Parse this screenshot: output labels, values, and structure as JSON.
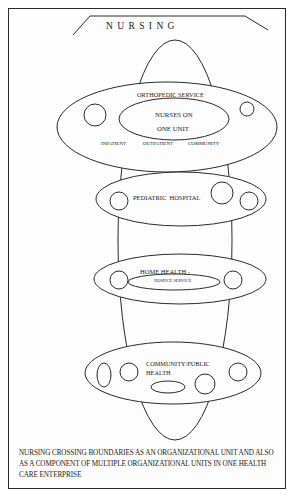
{
  "title": "N U R S I N G",
  "units": {
    "orthopedic": {
      "label": "ORTHOPEDIC SERVICE",
      "core_line1": "NURSES ON",
      "core_line2": "ONE UNIT",
      "settings": [
        "INPATIENT",
        "OUTPATIENT",
        "COMMUNITY"
      ]
    },
    "pediatric": {
      "label": "PEDIATRIC  HOSPITAL"
    },
    "home_health": {
      "label": "HOME HEALTH -",
      "sublabel": "HOSPICE SERVICE"
    },
    "community": {
      "label_line1": "COMMUNITY/PUBLIC",
      "label_line2": "HEALTH"
    }
  },
  "caption": "NURSING CROSSING BOUNDARIES AS AN ORGANIZATIONAL UNIT AND ALSO AS A COMPONENT OF MULTIPLE ORGANIZATIONAL UNITS IN ONE HEALTH CARE ENTERPRISE",
  "colors": {
    "stroke": "#2a2a2a",
    "background": "#ffffff"
  }
}
